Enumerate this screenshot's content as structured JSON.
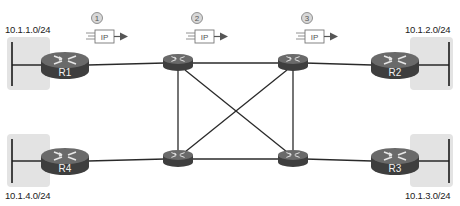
{
  "subnets": [
    {
      "id": "lan1",
      "label": "10.1.1.0/24",
      "router": "R1"
    },
    {
      "id": "lan2",
      "label": "10.1.2.0/24",
      "router": "R2"
    },
    {
      "id": "lan3",
      "label": "10.1.3.0/24",
      "router": "R3"
    },
    {
      "id": "lan4",
      "label": "10.1.4.0/24",
      "router": "R4"
    }
  ],
  "edge_routers": [
    {
      "id": "R1",
      "label": "R1"
    },
    {
      "id": "R2",
      "label": "R2"
    },
    {
      "id": "R3",
      "label": "R3"
    },
    {
      "id": "R4",
      "label": "R4"
    }
  ],
  "core_routers": [
    {
      "id": "core-top-left"
    },
    {
      "id": "core-top-right"
    },
    {
      "id": "core-bottom-left"
    },
    {
      "id": "core-bottom-right"
    }
  ],
  "packets": [
    {
      "step": "1",
      "label": "IP"
    },
    {
      "step": "2",
      "label": "IP"
    },
    {
      "step": "3",
      "label": "IP"
    }
  ],
  "links": [
    [
      "R1",
      "core-top-left"
    ],
    [
      "core-top-left",
      "core-top-right"
    ],
    [
      "core-top-right",
      "R2"
    ],
    [
      "R4",
      "core-bottom-left"
    ],
    [
      "core-bottom-left",
      "core-bottom-right"
    ],
    [
      "core-bottom-right",
      "R3"
    ],
    [
      "core-top-left",
      "core-bottom-left"
    ],
    [
      "core-top-right",
      "core-bottom-right"
    ],
    [
      "core-top-left",
      "core-bottom-right"
    ],
    [
      "core-top-right",
      "core-bottom-left"
    ]
  ],
  "colors": {
    "lan_box": "#e3e3e3",
    "router_body": "#4a4a4a",
    "router_top": "#6a6a6a",
    "link": "#2a2a2a",
    "arrow": "#555555"
  }
}
